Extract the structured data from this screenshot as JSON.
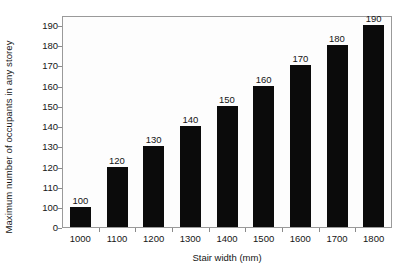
{
  "chart_data": {
    "type": "bar",
    "title": "",
    "xlabel": "Stair width (mm)",
    "ylabel": "Maximum number of occupants in any storey",
    "categories": [
      "1000",
      "1100",
      "1200",
      "1300",
      "1400",
      "1500",
      "1600",
      "1700",
      "1800"
    ],
    "values": [
      100,
      120,
      130,
      140,
      150,
      160,
      170,
      180,
      190
    ],
    "data_labels": [
      "100",
      "120",
      "130",
      "140",
      "150",
      "160",
      "170",
      "180",
      "190"
    ],
    "yticks": [
      "0",
      "100",
      "110",
      "120",
      "130",
      "140",
      "150",
      "160",
      "170",
      "180",
      "190"
    ],
    "ytick_values": [
      0,
      100,
      110,
      120,
      130,
      140,
      150,
      160,
      170,
      180,
      190
    ],
    "ylim": [
      0,
      196
    ],
    "axis_break": "y-axis compressed between 0 and 100",
    "grid": false,
    "legend": null,
    "bar_color": "#0b0b0b",
    "frame_color": "#9a9a9a",
    "plot_background": "#fdfdfd"
  }
}
